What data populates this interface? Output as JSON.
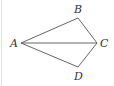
{
  "diagram": {
    "type": "quadrilateral with diagonal",
    "points": [
      {
        "label": "A",
        "x": 21,
        "y": 43,
        "lx": 10,
        "ly": 47
      },
      {
        "label": "B",
        "x": 78,
        "y": 18,
        "lx": 74,
        "ly": 13
      },
      {
        "label": "C",
        "x": 97,
        "y": 43,
        "lx": 100,
        "ly": 47
      },
      {
        "label": "D",
        "x": 78,
        "y": 67,
        "lx": 74,
        "ly": 80
      }
    ],
    "segments": [
      [
        "A",
        "B"
      ],
      [
        "B",
        "C"
      ],
      [
        "C",
        "D"
      ],
      [
        "D",
        "A"
      ],
      [
        "A",
        "C"
      ]
    ],
    "stroke": "#555555"
  }
}
